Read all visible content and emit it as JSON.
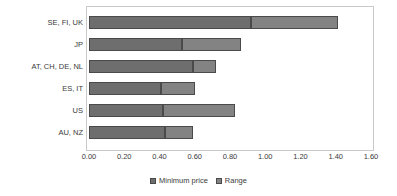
{
  "chart_data": {
    "type": "bar",
    "orientation": "horizontal",
    "stacked": true,
    "title": "",
    "xlabel": "",
    "ylabel": "",
    "xlim": [
      0.0,
      1.6
    ],
    "xticks": [
      "0.00",
      "0.20",
      "0.40",
      "0.60",
      "0.80",
      "1.00",
      "1.20",
      "1.40",
      "1.60"
    ],
    "xtick_values": [
      0.0,
      0.2,
      0.4,
      0.6,
      0.8,
      1.0,
      1.2,
      1.4,
      1.6
    ],
    "grid": false,
    "legend_position": "bottom",
    "categories": [
      "SE, FI, UK",
      "JP",
      "AT, CH, DE, NL",
      "ES, IT",
      "US",
      "AU, NZ"
    ],
    "series": [
      {
        "name": "Minimum  price",
        "color": "#6e6e6e",
        "values": [
          0.92,
          0.53,
          0.59,
          0.41,
          0.42,
          0.43
        ]
      },
      {
        "name": "Range",
        "color": "#838383",
        "values": [
          0.49,
          0.33,
          0.13,
          0.19,
          0.41,
          0.16
        ]
      }
    ],
    "totals": [
      1.41,
      0.86,
      0.72,
      0.6,
      0.83,
      0.59
    ]
  },
  "legend": {
    "items": [
      {
        "label": "Minimum  price",
        "swatch": "#6e6e6e"
      },
      {
        "label": "Range",
        "swatch": "#838383"
      }
    ]
  }
}
